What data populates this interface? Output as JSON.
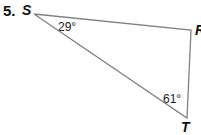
{
  "problem": {
    "number": "5.",
    "vertices": [
      {
        "name": "S",
        "x": 34,
        "y": 14
      },
      {
        "name": "R",
        "x": 191,
        "y": 30
      },
      {
        "name": "T",
        "x": 187,
        "y": 118
      }
    ],
    "angles": [
      {
        "vertex": "S",
        "label": "29°"
      },
      {
        "vertex": "T",
        "label": "61°"
      }
    ],
    "line_color": "#808080"
  }
}
